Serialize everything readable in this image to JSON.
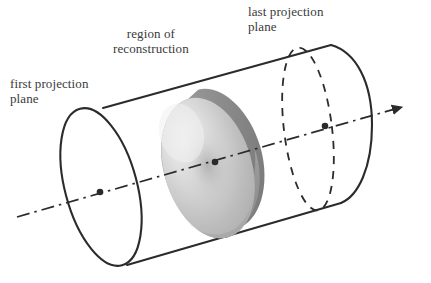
{
  "figure": {
    "title": "Cone-beam tomography acquisition geometry",
    "labels": {
      "first_plane": "first projection\nplane",
      "region": "region of\nreconstruction",
      "last_plane": "last projection\nplane"
    },
    "colors": {
      "stroke": "#2b2b2b",
      "text": "#3a3a3a",
      "background": "#ffffff",
      "disk_light": "#e8e8e8",
      "disk_mid": "#b9b9b9",
      "disk_shadow": "#8a8a8a",
      "disk_dark": "#6f6f6f",
      "axis": "#3a3a3a"
    },
    "geometry": {
      "axis_line": "dash-dot",
      "axis_start": [
        17,
        217
      ],
      "axis_end": [
        410,
        105
      ],
      "arrowhead": [
        408,
        105
      ],
      "first_plane_ellipse": {
        "cx": 101,
        "cy": 192,
        "rx": 35,
        "ry": 82,
        "rotation": -16,
        "style": "solid"
      },
      "last_plane_ellipse": {
        "cx": 308,
        "cy": 128,
        "rx": 24,
        "ry": 82,
        "rotation": -16,
        "style": "dashed"
      },
      "far_cap_arc": {
        "cx": 336,
        "cy": 125,
        "rx": 36,
        "ry": 80,
        "style": "solid"
      },
      "reconstruction_disk": {
        "cx": 218,
        "cy": 159,
        "rx": 50,
        "ry": 72,
        "rotation": -16
      },
      "marker_dots": [
        [
          100,
          192
        ],
        [
          215,
          162
        ],
        [
          325,
          126
        ]
      ],
      "top_edge": [
        [
          103,
          108
        ],
        [
          331,
          45
        ]
      ],
      "bottom_edge": [
        [
          127,
          265
        ],
        [
          341,
          203
        ]
      ]
    }
  }
}
